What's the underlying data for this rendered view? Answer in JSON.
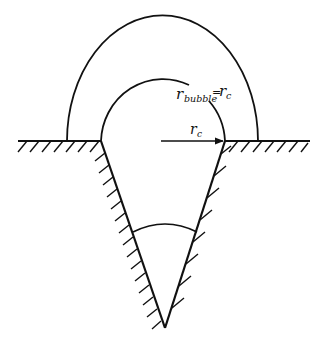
{
  "figure": {
    "colors": {
      "line": "#111111",
      "background": "#ffffff"
    },
    "labels": {
      "bubble_radius_main": "r",
      "bubble_radius_sub": "bubble",
      "equals": "=",
      "cavity_radius_main": "r",
      "cavity_radius_sub": "c"
    },
    "elements": [
      "surface-line-left",
      "surface-line-right",
      "hatching",
      "conical-cavity",
      "outer-bubble-arc",
      "inner-bubble-arc",
      "cavity-radius-arrow",
      "cone-angle-arc"
    ]
  }
}
